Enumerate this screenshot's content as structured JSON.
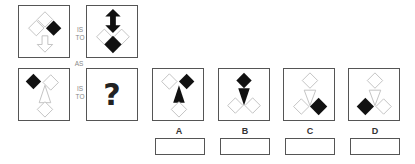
{
  "puzzle": {
    "connectors": {
      "row1_is": "IS",
      "row1_to": "TO",
      "as": "AS",
      "row2_is": "IS",
      "row2_to": "TO"
    },
    "question_mark": "?",
    "panels": [
      {
        "id": "premise-a",
        "description": "Top outline diamond, left outline diamond, right filled diamond, outline down arrow below"
      },
      {
        "id": "premise-b",
        "description": "Filled double-headed/up arrow on top, left and right outline diamonds, filled diamond at bottom"
      },
      {
        "id": "premise-c",
        "description": "Filled diamond upper-left, outline diamond upper-right, outline up triangle, outline diamond bottom"
      },
      {
        "id": "unknown",
        "description": "Question mark"
      }
    ],
    "options": [
      {
        "label": "A",
        "description": "Outline diamond upper-left, filled diamond upper-right, filled up triangle, outline diamond bottom"
      },
      {
        "label": "B",
        "description": "Filled diamond top, filled down triangle, two outline diamonds bottom"
      },
      {
        "label": "C",
        "description": "Outline diamond top, outline down triangle, outline diamond bottom-left, filled diamond bottom-right"
      },
      {
        "label": "D",
        "description": "Outline diamond top, outline down triangle, filled diamond bottom-left, outline diamond bottom-right"
      }
    ],
    "answer_values": [
      "",
      "",
      "",
      ""
    ]
  },
  "colors": {
    "border": "#555555",
    "fill": "#111111",
    "outline": "#bbbbbb",
    "text": "#333333"
  }
}
